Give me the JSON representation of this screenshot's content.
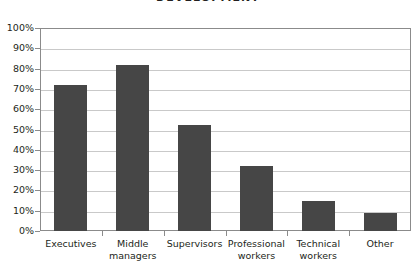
{
  "chart_data": {
    "type": "bar",
    "title": "DEVELOPMENT",
    "xlabel": "",
    "ylabel": "",
    "ylim": [
      0,
      100
    ],
    "grid": true,
    "legend": "none",
    "categories": [
      "Executives",
      "Middle managers",
      "Supervisors",
      "Professional workers",
      "Technical workers",
      "Other"
    ],
    "category_lines": [
      [
        "Executives"
      ],
      [
        "Middle",
        "managers"
      ],
      [
        "Supervisors"
      ],
      [
        "Professional",
        "workers"
      ],
      [
        "Technical",
        "workers"
      ],
      [
        "Other"
      ]
    ],
    "values": [
      72,
      82,
      52,
      32,
      15,
      9
    ],
    "yticks": [
      0,
      10,
      20,
      30,
      40,
      50,
      60,
      70,
      80,
      90,
      100
    ],
    "ytick_labels": [
      "0%",
      "10%",
      "20%",
      "30%",
      "40%",
      "50%",
      "60%",
      "70%",
      "80%",
      "90%",
      "100%"
    ],
    "bar_color": "#464646",
    "grid_color": "#c9c9c9",
    "axis_color": "#8b8b8b",
    "background_color": "#ffffff"
  }
}
